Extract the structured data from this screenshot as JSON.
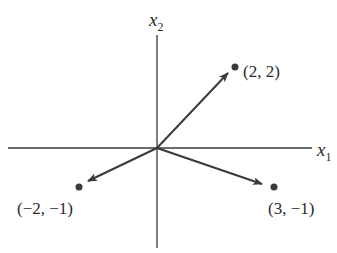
{
  "diagram": {
    "type": "vector-plot",
    "axes": {
      "horizontal": {
        "label": "x",
        "subscript": "1"
      },
      "vertical": {
        "label": "x",
        "subscript": "2"
      }
    },
    "points": [
      {
        "id": "p1",
        "label": "(2, 2)",
        "x": 2,
        "y": 2
      },
      {
        "id": "p2",
        "label": "(3, −1)",
        "x": 3,
        "y": -1
      },
      {
        "id": "p3",
        "label": "(−2, −1)",
        "x": -2,
        "y": -1
      }
    ],
    "colors": {
      "line": "#3a3a3a",
      "dot": "#3a3a3a",
      "text": "#2a2a2a",
      "background": "#ffffff"
    }
  }
}
